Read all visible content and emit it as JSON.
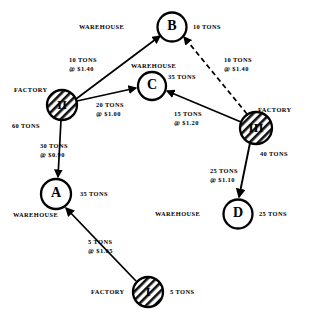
{
  "diagram": {
    "colors": {
      "ink": "#000000",
      "background": "#ffffff"
    },
    "nodes": [
      {
        "id": "B",
        "label": "B",
        "kind": "warehouse",
        "kind_label": "WAREHOUSE",
        "amount": "10 TONS",
        "hatched": false,
        "cx": 172,
        "cy": 27,
        "r": 14.5,
        "kind_label_x": 79,
        "kind_label_y": 23,
        "amount_x": 193,
        "amount_y": 23
      },
      {
        "id": "C",
        "label": "C",
        "kind": "warehouse",
        "kind_label": "WAREHOUSE",
        "amount": "35 TONS",
        "hatched": false,
        "cx": 152,
        "cy": 86,
        "r": 14,
        "kind_label_x": 131,
        "kind_label_y": 62,
        "amount_x": 168,
        "amount_y": 73
      },
      {
        "id": "II",
        "label": "II",
        "kind": "factory",
        "kind_label": "FACTORY",
        "amount": "60 TONS",
        "hatched": true,
        "cx": 62,
        "cy": 105,
        "r": 15,
        "kind_label_x": 14,
        "kind_label_y": 86,
        "amount_x": 12,
        "amount_y": 122
      },
      {
        "id": "III",
        "label": "III",
        "kind": "factory",
        "kind_label": "FACTORY",
        "amount": "40 TONS",
        "hatched": true,
        "cx": 256,
        "cy": 128,
        "r": 16,
        "kind_label_x": 258,
        "kind_label_y": 106,
        "amount_x": 260,
        "amount_y": 150
      },
      {
        "id": "A",
        "label": "A",
        "kind": "warehouse",
        "kind_label": "WAREHOUSE",
        "amount": "35 TONS",
        "hatched": false,
        "cx": 56,
        "cy": 194,
        "r": 15,
        "kind_label_x": 13,
        "kind_label_y": 211,
        "amount_x": 80,
        "amount_y": 190
      },
      {
        "id": "D",
        "label": "D",
        "kind": "warehouse",
        "kind_label": "WAREHOUSE",
        "amount": "25 TONS",
        "hatched": false,
        "cx": 238,
        "cy": 214,
        "r": 14.5,
        "kind_label_x": 155,
        "kind_label_y": 210,
        "amount_x": 259,
        "amount_y": 210
      },
      {
        "id": "I",
        "label": "I",
        "kind": "factory",
        "kind_label": "FACTORY",
        "amount": "5 TONS",
        "hatched": true,
        "cx": 148,
        "cy": 292,
        "r": 15,
        "kind_label_x": 91,
        "kind_label_y": 288,
        "amount_x": 170,
        "amount_y": 288
      }
    ],
    "edges": [
      {
        "from": "II",
        "to": "B",
        "style": "solid",
        "tons": "10 TONS",
        "price": "@ $1.40",
        "label_x": 69,
        "label_y": 56
      },
      {
        "from": "II",
        "to": "C",
        "style": "solid",
        "tons": "20 TONS",
        "price": "@ $1.00",
        "label_x": 96,
        "label_y": 101
      },
      {
        "from": "II",
        "to": "A",
        "style": "solid",
        "tons": "30 TONS",
        "price": "@ $0.90",
        "label_x": 40,
        "label_y": 142
      },
      {
        "from": "III",
        "to": "B",
        "style": "dashed",
        "tons": "10 TONS",
        "price": "@ $1.40",
        "label_x": 224,
        "label_y": 56
      },
      {
        "from": "III",
        "to": "C",
        "style": "solid",
        "tons": "15 TONS",
        "price": "@ $1.20",
        "label_x": 174,
        "label_y": 110
      },
      {
        "from": "III",
        "to": "D",
        "style": "solid",
        "tons": "25 TONS",
        "price": "@ $1.10",
        "label_x": 210,
        "label_y": 167
      },
      {
        "from": "I",
        "to": "A",
        "style": "solid",
        "tons": "5 TONS",
        "price": "@ $1.05",
        "label_x": 88,
        "label_y": 238
      }
    ]
  }
}
